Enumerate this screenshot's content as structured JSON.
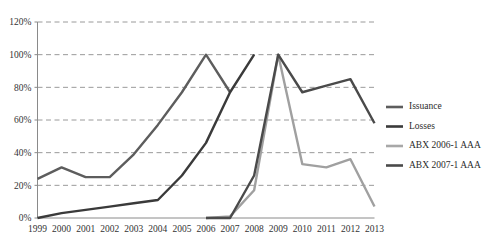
{
  "chart_data": {
    "type": "line",
    "title": "",
    "xlabel": "",
    "ylabel": "",
    "categories": [
      "1999",
      "2000",
      "2001",
      "2002",
      "2003",
      "2004",
      "2005",
      "2006",
      "2007",
      "2008",
      "2009",
      "2010",
      "2011",
      "2012",
      "2013"
    ],
    "x": [
      1999,
      2000,
      2001,
      2002,
      2003,
      2004,
      2005,
      2006,
      2007,
      2008,
      2009,
      2010,
      2011,
      2012,
      2013
    ],
    "ylim": [
      0,
      120
    ],
    "xlim": [
      1999,
      2013
    ],
    "yticks": [
      0,
      20,
      40,
      60,
      80,
      100,
      120
    ],
    "ytick_labels": [
      "0%",
      "20%",
      "40%",
      "60%",
      "80%",
      "100%",
      "120%"
    ],
    "grid": true,
    "grid_style": "dashed-horizontal",
    "legend_position": "right",
    "series": [
      {
        "name": "Issuance",
        "color": "#5a5a5a",
        "values": [
          null,
          null,
          null,
          null,
          null,
          null,
          null,
          100,
          77,
          null,
          null,
          null,
          null,
          null,
          null
        ]
      },
      {
        "name": "Losses",
        "color": "#3d3d3d",
        "values": [
          null,
          null,
          null,
          null,
          null,
          null,
          null,
          0,
          0,
          26,
          100,
          77,
          81,
          85,
          58
        ]
      },
      {
        "name": "ABX 2006-1 AAA",
        "color": "#9e9e9e",
        "values": [
          0,
          3,
          5,
          7,
          9,
          11,
          26,
          46,
          77,
          null,
          null,
          null,
          null,
          null,
          null
        ]
      },
      {
        "name": "ABX 2007-1 AAA",
        "color": "#4a4a4a",
        "values": [
          24,
          31,
          25,
          25,
          39,
          57,
          77,
          100,
          null,
          null,
          null,
          null,
          null,
          null,
          null
        ]
      }
    ],
    "plotted_segments": [
      {
        "name": "Issuance",
        "color": "#5d5d5d",
        "width": 2.4,
        "points": [
          [
            1999,
            24
          ],
          [
            2000,
            31
          ],
          [
            2001,
            25
          ],
          [
            2002,
            25
          ],
          [
            2003,
            39
          ],
          [
            2004,
            57
          ],
          [
            2005,
            77
          ],
          [
            2006,
            100
          ],
          [
            2007,
            77
          ]
        ]
      },
      {
        "name": "Losses",
        "color": "#3a3a3a",
        "width": 2.4,
        "points": [
          [
            1999,
            0
          ],
          [
            2000,
            3
          ],
          [
            2001,
            5
          ],
          [
            2002,
            7
          ],
          [
            2003,
            9
          ],
          [
            2004,
            11
          ],
          [
            2005,
            26
          ],
          [
            2006,
            46
          ],
          [
            2007,
            77
          ],
          [
            2008,
            100
          ]
        ]
      },
      {
        "name": "ABX 2006-1 AAA",
        "color": "#a0a0a0",
        "width": 2.4,
        "points": [
          [
            2006,
            0
          ],
          [
            2007,
            1
          ],
          [
            2008,
            17
          ],
          [
            2009,
            100
          ],
          [
            2010,
            33
          ],
          [
            2011,
            31
          ],
          [
            2012,
            36
          ],
          [
            2013,
            7
          ]
        ]
      },
      {
        "name": "ABX 2007-1 AAA",
        "color": "#4a4a4a",
        "width": 2.4,
        "points": [
          [
            2006,
            0
          ],
          [
            2007,
            0
          ],
          [
            2008,
            26
          ],
          [
            2009,
            100
          ],
          [
            2010,
            77
          ],
          [
            2011,
            81
          ],
          [
            2012,
            85
          ],
          [
            2013,
            58
          ]
        ]
      }
    ]
  },
  "legend": {
    "items": [
      {
        "label": "Issuance",
        "color": "#5d5d5d"
      },
      {
        "label": "Losses",
        "color": "#3a3a3a"
      },
      {
        "label": "ABX 2006-1 AAA",
        "color": "#a8a8a8"
      },
      {
        "label": "ABX 2007-1 AAA",
        "color": "#4a4a4a"
      }
    ]
  },
  "axes": {
    "y_labels": [
      "120%",
      "100%",
      "80%",
      "60%",
      "40%",
      "20%",
      "0%"
    ],
    "x_labels": [
      "1999",
      "2000",
      "2001",
      "2002",
      "2003",
      "2004",
      "2005",
      "2006",
      "2007",
      "2008",
      "2009",
      "2010",
      "2011",
      "2012",
      "2013"
    ],
    "grid_color": "#9a9a9a",
    "axis_color": "#8a8a8a"
  }
}
